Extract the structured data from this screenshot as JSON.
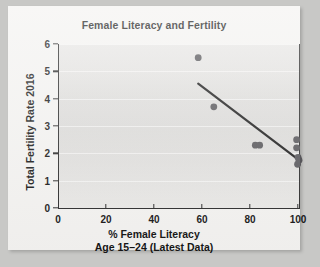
{
  "chart_data": {
    "type": "scatter",
    "title": "Female Literacy and Fertility",
    "xlabel_line1": "% Female Literacy",
    "xlabel_line2": "Age 15–24 (Latest Data)",
    "ylabel": "Total Fertility Rate 2016",
    "xlim": [
      0,
      100
    ],
    "ylim": [
      0,
      6
    ],
    "xticks": [
      0,
      20,
      40,
      60,
      80,
      100
    ],
    "yticks": [
      0,
      1,
      2,
      3,
      4,
      5,
      6
    ],
    "grid": "horizontal-faint",
    "legend": "none",
    "marker_color": "#57565a",
    "trendline_color": "#1a1a1a",
    "points": [
      {
        "x": 58.0,
        "y": 5.5
      },
      {
        "x": 64.5,
        "y": 3.7
      },
      {
        "x": 81.8,
        "y": 2.3
      },
      {
        "x": 83.6,
        "y": 2.3
      },
      {
        "x": 99.0,
        "y": 2.5
      },
      {
        "x": 99.0,
        "y": 2.2
      },
      {
        "x": 99.6,
        "y": 1.85
      },
      {
        "x": 99.4,
        "y": 1.6
      },
      {
        "x": 100.0,
        "y": 1.75
      }
    ],
    "trendline": {
      "x_start": 58.0,
      "y_start": 4.55,
      "x_end": 100.0,
      "y_end": 1.75
    }
  }
}
